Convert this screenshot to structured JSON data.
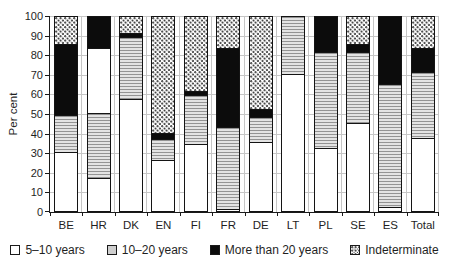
{
  "colors": {
    "background": "#ffffff",
    "bar_border": "#141414",
    "black_fill": "#0c0c0c",
    "gray_fill": "#e3e3e3",
    "gridline": "#c6c6c6",
    "axis": "#1a1a1a",
    "text": "#1f1f1f"
  },
  "chart_data": {
    "type": "bar",
    "stacked": true,
    "orientation": "vertical",
    "title": "",
    "xlabel": "",
    "ylabel": "Per cent",
    "ylim": [
      0,
      100
    ],
    "yticks": [
      0,
      10,
      20,
      30,
      40,
      50,
      60,
      70,
      80,
      90,
      100
    ],
    "grid": "horizontal gridlines every 10 plus vertical category separators",
    "legend_position": "bottom",
    "categories": [
      "BE",
      "HR",
      "DK",
      "EN",
      "FI",
      "FR",
      "DE",
      "LT",
      "PL",
      "SE",
      "ES",
      "Total"
    ],
    "legend": [
      {
        "key": "y5_10",
        "label": "5–10 years",
        "swatch": "white"
      },
      {
        "key": "y10_20",
        "label": "10–20 years",
        "swatch": "gray"
      },
      {
        "key": "y20plus",
        "label": "More than 20 years",
        "swatch": "black"
      },
      {
        "key": "indet",
        "label": "Indeterminate",
        "swatch": "dotted"
      }
    ],
    "series": [
      {
        "name": "5–10 years",
        "values": [
          30,
          50,
          57,
          26,
          34,
          1,
          35,
          70,
          32,
          45,
          2,
          37
        ]
      },
      {
        "name": "10–20 years",
        "values": [
          19,
          33,
          32,
          11,
          25,
          42,
          13,
          30,
          49,
          36,
          63,
          34
        ]
      },
      {
        "name": "More than 20 years",
        "values": [
          36,
          17,
          2,
          3,
          2,
          40,
          4,
          0,
          19,
          4,
          35,
          12
        ]
      },
      {
        "name": "Indeterminate",
        "values": [
          15,
          0,
          9,
          60,
          39,
          17,
          48,
          0,
          0,
          15,
          0,
          17
        ]
      }
    ],
    "bars": [
      {
        "label": "BE",
        "segments": [
          {
            "key": "y5_10",
            "value": 30
          },
          {
            "key": "y10_20",
            "value": 19
          },
          {
            "key": "y20plus",
            "value": 36
          },
          {
            "key": "indet",
            "value": 15
          }
        ]
      },
      {
        "label": "HR",
        "segments": [
          {
            "key": "y5_10",
            "value": 17
          },
          {
            "key": "y10_20",
            "value": 33
          },
          {
            "key": "y5_10",
            "value": 33
          },
          {
            "key": "y20plus",
            "value": 17
          }
        ]
      },
      {
        "label": "DK",
        "segments": [
          {
            "key": "y5_10",
            "value": 57
          },
          {
            "key": "y10_20",
            "value": 32
          },
          {
            "key": "y20plus",
            "value": 2
          },
          {
            "key": "indet",
            "value": 9
          }
        ]
      },
      {
        "label": "EN",
        "segments": [
          {
            "key": "y5_10",
            "value": 26
          },
          {
            "key": "y10_20",
            "value": 11
          },
          {
            "key": "y20plus",
            "value": 3
          },
          {
            "key": "indet",
            "value": 60
          }
        ]
      },
      {
        "label": "FI",
        "segments": [
          {
            "key": "y5_10",
            "value": 34
          },
          {
            "key": "y10_20",
            "value": 25
          },
          {
            "key": "y20plus",
            "value": 2
          },
          {
            "key": "indet",
            "value": 39
          }
        ]
      },
      {
        "label": "FR",
        "segments": [
          {
            "key": "y5_10",
            "value": 1
          },
          {
            "key": "y10_20",
            "value": 42
          },
          {
            "key": "y20plus",
            "value": 40
          },
          {
            "key": "indet",
            "value": 17
          }
        ]
      },
      {
        "label": "DE",
        "segments": [
          {
            "key": "y5_10",
            "value": 35
          },
          {
            "key": "y10_20",
            "value": 13
          },
          {
            "key": "y20plus",
            "value": 4
          },
          {
            "key": "indet",
            "value": 48
          }
        ]
      },
      {
        "label": "LT",
        "segments": [
          {
            "key": "y5_10",
            "value": 70
          },
          {
            "key": "y10_20",
            "value": 30
          }
        ]
      },
      {
        "label": "PL",
        "segments": [
          {
            "key": "y5_10",
            "value": 32
          },
          {
            "key": "y10_20",
            "value": 49
          },
          {
            "key": "y20plus",
            "value": 19
          }
        ]
      },
      {
        "label": "SE",
        "segments": [
          {
            "key": "y5_10",
            "value": 45
          },
          {
            "key": "y10_20",
            "value": 36
          },
          {
            "key": "y20plus",
            "value": 4
          },
          {
            "key": "indet",
            "value": 15
          }
        ]
      },
      {
        "label": "ES",
        "segments": [
          {
            "key": "y5_10",
            "value": 2
          },
          {
            "key": "y10_20",
            "value": 63
          },
          {
            "key": "y20plus",
            "value": 35
          }
        ]
      },
      {
        "label": "Total",
        "segments": [
          {
            "key": "y5_10",
            "value": 37
          },
          {
            "key": "y10_20",
            "value": 34
          },
          {
            "key": "y20plus",
            "value": 12
          },
          {
            "key": "indet",
            "value": 17
          }
        ]
      }
    ]
  }
}
